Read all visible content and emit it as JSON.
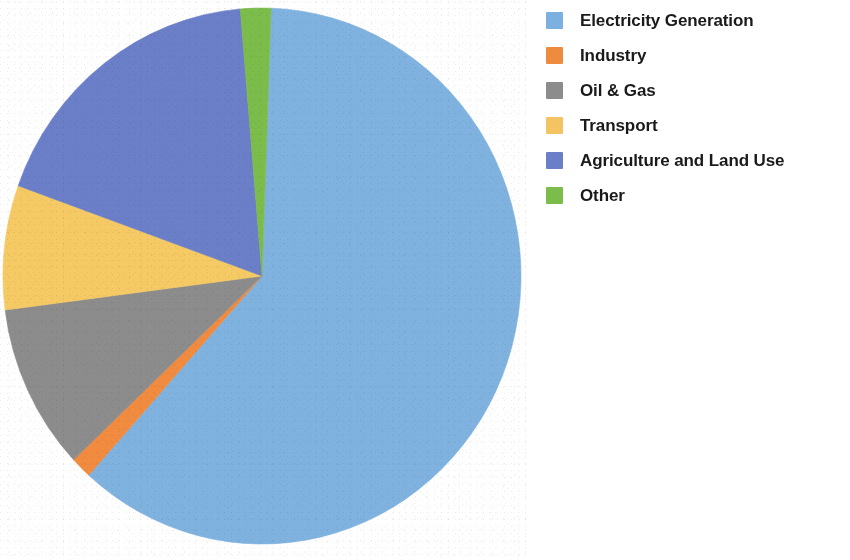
{
  "chart_data": {
    "type": "pie",
    "title": "",
    "subtitle": "",
    "xlabel": "",
    "ylabel": "",
    "legend_position": "right",
    "grid": false,
    "start_angle_deg": 2,
    "direction": "clockwise",
    "categories": [
      "Electricity Generation",
      "Industry",
      "Oil & Gas",
      "Transport",
      "Agriculture and Land Use",
      "Other"
    ],
    "values": [
      61.0,
      1.3,
      10.0,
      7.5,
      18.2,
      2.0
    ],
    "colors": [
      "#7FB2DF",
      "#F08B3F",
      "#8C8C8C",
      "#F5C963",
      "#6B7FC9",
      "#7CBC4A"
    ],
    "slices": [
      {
        "label": "Electricity Generation",
        "value": 61.0,
        "color": "#7FB2DF",
        "start_deg": 2,
        "end_deg": 222
      },
      {
        "label": "Industry",
        "value": 1.3,
        "color": "#F08B3F",
        "start_deg": 222,
        "end_deg": 226.7
      },
      {
        "label": "Oil & Gas",
        "value": 10.0,
        "color": "#8C8C8C",
        "start_deg": 226.7,
        "end_deg": 262.7
      },
      {
        "label": "Transport",
        "value": 7.5,
        "color": "#F5C963",
        "start_deg": 262.7,
        "end_deg": 289.7
      },
      {
        "label": "Agriculture and Land Use",
        "value": 18.2,
        "color": "#6B7FC9",
        "start_deg": 289.7,
        "end_deg": 355.2
      },
      {
        "label": "Other",
        "value": 2.0,
        "color": "#7CBC4A",
        "start_deg": 355.2,
        "end_deg": 362
      }
    ]
  },
  "pie": {
    "center_x": 262,
    "center_y": 276,
    "radius_x": 259,
    "radius_y": 268
  },
  "legend": {
    "items": [
      {
        "label": "Electricity Generation",
        "color": "#7BB0E0",
        "swatch_name": "legend-swatch-electricity-generation"
      },
      {
        "label": "Industry",
        "color": "#EE8B3F",
        "swatch_name": "legend-swatch-industry"
      },
      {
        "label": "Oil & Gas",
        "color": "#8C8C8C",
        "swatch_name": "legend-swatch-oil-and-gas"
      },
      {
        "label": "Transport",
        "color": "#F5C462",
        "swatch_name": "legend-swatch-transport"
      },
      {
        "label": "Agriculture and Land Use",
        "color": "#6B7FC9",
        "swatch_name": "legend-swatch-agriculture-and-land-use"
      },
      {
        "label": "Other",
        "color": "#7CBC4A",
        "swatch_name": "legend-swatch-other"
      }
    ]
  }
}
